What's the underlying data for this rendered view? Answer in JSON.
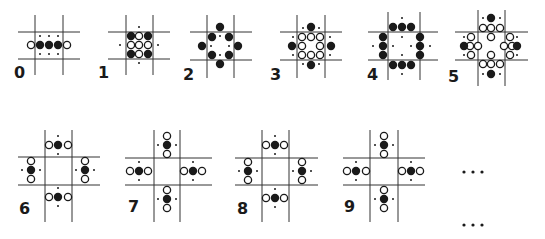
{
  "figure": {
    "legend": {
      "filled_circle": "black",
      "open_circle": "white",
      "small_dot": "empty site marker"
    },
    "colors": {
      "ink": "#1a1a1a",
      "line": "#333333",
      "background": "#ffffff"
    },
    "panels": [
      {
        "label": "0",
        "label_pos": [
          14,
          78
        ],
        "lines": {
          "v": [
            35,
            63
          ],
          "h": [
            32,
            59
          ],
          "vspan": [
            15,
            75
          ],
          "hspan": [
            18,
            80
          ]
        },
        "filled": [
          [
            40,
            45
          ],
          [
            49,
            45
          ],
          [
            58,
            45
          ]
        ],
        "open": [
          [
            31,
            45
          ],
          [
            67,
            45
          ]
        ],
        "dots": [
          [
            40,
            36
          ],
          [
            49,
            36
          ],
          [
            58,
            36
          ],
          [
            40,
            54
          ],
          [
            49,
            54
          ],
          [
            58,
            54
          ]
        ]
      },
      {
        "label": "1",
        "label_pos": [
          98,
          78
        ],
        "lines": {
          "v": [
            126,
            153
          ],
          "h": [
            32,
            59
          ],
          "vspan": [
            15,
            75
          ],
          "hspan": [
            108,
            170
          ]
        },
        "filled": [
          [
            131,
            36
          ],
          [
            148,
            36
          ],
          [
            131,
            54
          ],
          [
            148,
            54
          ]
        ],
        "open": [
          [
            139,
            36
          ],
          [
            131,
            45
          ],
          [
            139,
            45
          ],
          [
            148,
            45
          ],
          [
            139,
            54
          ]
        ],
        "dots": [
          [
            139,
            27
          ],
          [
            120,
            45
          ],
          [
            158,
            45
          ],
          [
            139,
            63
          ]
        ]
      },
      {
        "label": "2",
        "label_pos": [
          183,
          80
        ],
        "lines": {
          "v": [
            207,
            234
          ],
          "h": [
            32,
            60
          ],
          "vspan": [
            15,
            78
          ],
          "hspan": [
            190,
            252
          ]
        },
        "filled": [
          [
            220,
            27
          ],
          [
            212,
            37
          ],
          [
            229,
            37
          ],
          [
            202,
            46
          ],
          [
            238,
            46
          ],
          [
            212,
            55
          ],
          [
            229,
            55
          ],
          [
            220,
            64
          ]
        ],
        "open": [],
        "dots": [
          [
            220,
            36
          ],
          [
            211,
            46
          ],
          [
            229,
            46
          ],
          [
            220,
            55
          ]
        ]
      },
      {
        "label": "3",
        "label_pos": [
          270,
          80
        ],
        "lines": {
          "v": [
            297,
            325
          ],
          "h": [
            32,
            60
          ],
          "vspan": [
            15,
            78
          ],
          "hspan": [
            280,
            342
          ]
        },
        "filled": [
          [
            311,
            27
          ],
          [
            292,
            46
          ],
          [
            331,
            46
          ],
          [
            311,
            65
          ]
        ],
        "open": [
          [
            302,
            37
          ],
          [
            311,
            37
          ],
          [
            320,
            37
          ],
          [
            302,
            46
          ],
          [
            320,
            46
          ],
          [
            302,
            55
          ],
          [
            311,
            55
          ],
          [
            320,
            55
          ]
        ],
        "dots": [
          [
            303,
            28
          ],
          [
            319,
            28
          ],
          [
            293,
            37
          ],
          [
            330,
            37
          ],
          [
            293,
            55
          ],
          [
            330,
            55
          ],
          [
            303,
            64
          ],
          [
            319,
            64
          ]
        ]
      },
      {
        "label": "4",
        "label_pos": [
          367,
          80
        ],
        "lines": {
          "v": [
            388,
            420
          ],
          "h": [
            32,
            60
          ],
          "vspan": [
            12,
            80
          ],
          "hspan": [
            368,
            438
          ]
        },
        "filled": [
          [
            393,
            27
          ],
          [
            402,
            27
          ],
          [
            411,
            27
          ],
          [
            383,
            37
          ],
          [
            383,
            46
          ],
          [
            383,
            55
          ],
          [
            420,
            37
          ],
          [
            420,
            46
          ],
          [
            420,
            55
          ],
          [
            393,
            65
          ],
          [
            402,
            65
          ],
          [
            411,
            65
          ]
        ],
        "open": [],
        "dots": [
          [
            402,
            18
          ],
          [
            402,
            37
          ],
          [
            373,
            46
          ],
          [
            393,
            46
          ],
          [
            411,
            46
          ],
          [
            430,
            46
          ],
          [
            402,
            55
          ],
          [
            402,
            74
          ]
        ]
      },
      {
        "label": "5",
        "label_pos": [
          448,
          82
        ],
        "lines": {
          "v": [
            478,
            505
          ],
          "h": [
            32,
            60
          ],
          "vspan": [
            10,
            86
          ],
          "hspan": [
            455,
            528
          ]
        },
        "filled": [
          [
            491,
            18
          ],
          [
            464,
            46
          ],
          [
            517,
            46
          ],
          [
            491,
            74
          ]
        ],
        "open": [
          [
            483,
            28
          ],
          [
            491,
            28
          ],
          [
            500,
            28
          ],
          [
            491,
            37
          ],
          [
            471,
            37
          ],
          [
            470,
            46
          ],
          [
            478,
            46
          ],
          [
            471,
            55
          ],
          [
            510,
            37
          ],
          [
            512,
            46
          ],
          [
            504,
            46
          ],
          [
            510,
            55
          ],
          [
            491,
            55
          ],
          [
            483,
            64
          ],
          [
            491,
            64
          ],
          [
            500,
            64
          ]
        ],
        "dots": [
          [
            483,
            18
          ],
          [
            500,
            18
          ],
          [
            464,
            37
          ],
          [
            517,
            37
          ],
          [
            464,
            55
          ],
          [
            517,
            55
          ],
          [
            483,
            74
          ],
          [
            500,
            74
          ]
        ]
      },
      {
        "label": "6",
        "label_pos": [
          19,
          214
        ],
        "lines": {
          "v": [
            45,
            72
          ],
          "h": [
            157,
            185
          ],
          "vspan": [
            130,
            222
          ],
          "hspan": [
            18,
            100
          ]
        },
        "filled": [
          [
            58,
            145
          ],
          [
            31,
            170
          ],
          [
            85,
            170
          ],
          [
            58,
            197
          ]
        ],
        "open": [
          [
            49,
            145
          ],
          [
            68,
            145
          ],
          [
            31,
            161
          ],
          [
            31,
            179
          ],
          [
            85,
            161
          ],
          [
            85,
            179
          ],
          [
            49,
            197
          ],
          [
            68,
            197
          ]
        ],
        "dots": [
          [
            58,
            136
          ],
          [
            58,
            154
          ],
          [
            22,
            170
          ],
          [
            40,
            170
          ],
          [
            76,
            170
          ],
          [
            94,
            170
          ],
          [
            58,
            188
          ],
          [
            58,
            206
          ]
        ]
      },
      {
        "label": "7",
        "label_pos": [
          128,
          212
        ],
        "lines": {
          "v": [
            154,
            180
          ],
          "h": [
            158,
            185
          ],
          "vspan": [
            130,
            222
          ],
          "hspan": [
            125,
            212
          ]
        },
        "filled": [
          [
            167,
            145
          ],
          [
            139,
            171
          ],
          [
            193,
            171
          ],
          [
            167,
            199
          ]
        ],
        "open": [
          [
            167,
            136
          ],
          [
            167,
            154
          ],
          [
            130,
            171
          ],
          [
            148,
            171
          ],
          [
            184,
            171
          ],
          [
            202,
            171
          ],
          [
            167,
            190
          ],
          [
            167,
            208
          ]
        ],
        "dots": [
          [
            158,
            145
          ],
          [
            176,
            145
          ],
          [
            139,
            162
          ],
          [
            139,
            180
          ],
          [
            193,
            162
          ],
          [
            193,
            180
          ],
          [
            158,
            199
          ],
          [
            176,
            199
          ]
        ]
      },
      {
        "label": "8",
        "label_pos": [
          237,
          214
        ],
        "lines": {
          "v": [
            262,
            289
          ],
          "h": [
            158,
            185
          ],
          "vspan": [
            130,
            222
          ],
          "hspan": [
            235,
            318
          ]
        },
        "filled": [
          [
            275,
            145
          ],
          [
            248,
            171
          ],
          [
            302,
            171
          ],
          [
            275,
            198
          ]
        ],
        "open": [
          [
            266,
            145
          ],
          [
            284,
            145
          ],
          [
            248,
            162
          ],
          [
            248,
            180
          ],
          [
            302,
            162
          ],
          [
            302,
            180
          ],
          [
            266,
            198
          ],
          [
            284,
            198
          ]
        ],
        "dots": [
          [
            275,
            136
          ],
          [
            275,
            154
          ],
          [
            239,
            171
          ],
          [
            257,
            171
          ],
          [
            293,
            171
          ],
          [
            311,
            171
          ],
          [
            275,
            189
          ],
          [
            275,
            207
          ]
        ]
      },
      {
        "label": "9",
        "label_pos": [
          344,
          212
        ],
        "lines": {
          "v": [
            370,
            398
          ],
          "h": [
            158,
            185
          ],
          "vspan": [
            130,
            222
          ],
          "hspan": [
            343,
            425
          ]
        },
        "filled": [
          [
            384,
            145
          ],
          [
            356,
            171
          ],
          [
            411,
            171
          ],
          [
            384,
            199
          ]
        ],
        "open": [
          [
            384,
            136
          ],
          [
            384,
            154
          ],
          [
            347,
            171
          ],
          [
            366,
            171
          ],
          [
            402,
            171
          ],
          [
            420,
            171
          ],
          [
            384,
            190
          ],
          [
            384,
            208
          ]
        ],
        "dots": [
          [
            375,
            145
          ],
          [
            393,
            145
          ],
          [
            356,
            162
          ],
          [
            356,
            180
          ],
          [
            411,
            162
          ],
          [
            411,
            180
          ],
          [
            375,
            199
          ],
          [
            393,
            199
          ]
        ]
      }
    ],
    "ellipses": [
      {
        "text": "...",
        "dots": [
          [
            464,
            172
          ],
          [
            473,
            172
          ],
          [
            482,
            172
          ]
        ]
      },
      {
        "text": "...",
        "dots": [
          [
            464,
            225
          ],
          [
            473,
            225
          ],
          [
            482,
            225
          ]
        ]
      }
    ]
  }
}
